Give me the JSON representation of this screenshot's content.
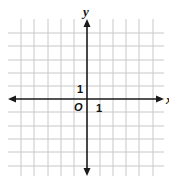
{
  "diagram": {
    "type": "coordinate-grid",
    "x_axis_label": "x",
    "y_axis_label": "y",
    "origin_label": "O",
    "x_unit_label": "1",
    "y_unit_label": "1",
    "grid": {
      "x_lines": [
        21,
        34,
        48,
        61,
        74,
        100,
        113,
        126,
        139,
        153
      ],
      "y_lines": [
        33,
        46,
        60,
        73,
        86,
        112,
        126,
        139,
        152,
        166
      ],
      "spacing_px": 13,
      "range_x": [
        -5,
        5
      ],
      "range_y": [
        -5,
        5
      ]
    },
    "colors": {
      "grid": "#c8c8c8",
      "axis": "#1a1a1a"
    }
  }
}
